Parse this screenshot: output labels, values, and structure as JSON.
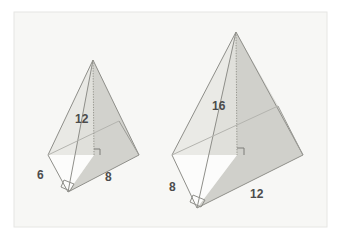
{
  "figure": {
    "title": "",
    "background_color": "#ffffff",
    "panel_color": "#f7f7f5",
    "panel_border_color": "#e3e3e0",
    "outline_color": "#8a8a86",
    "face_light_color": "#e4e4e0",
    "face_mid_color": "#d2d2cd",
    "face_dark_color": "#c0c0ba",
    "label_color": "#4c4c4c",
    "dash_color": "#9a9a95"
  },
  "shapes": [
    {
      "name": "left-pyramid",
      "labels": {
        "height": "12",
        "base_left_edge": "6",
        "base_right_edge": "8"
      },
      "geometry": {
        "apex": [
          93,
          60
        ],
        "base_left": [
          48,
          155
        ],
        "base_front": [
          68,
          192
        ],
        "base_right": [
          139,
          155
        ],
        "base_back": [
          119,
          121
        ],
        "foot": [
          94,
          155
        ]
      }
    },
    {
      "name": "right-pyramid",
      "labels": {
        "height": "16",
        "base_left_edge": "8",
        "base_right_edge": "12"
      },
      "geometry": {
        "apex": [
          236,
          32
        ],
        "base_left": [
          172,
          155
        ],
        "base_front": [
          197,
          208
        ],
        "base_right": [
          303,
          155
        ],
        "base_back": [
          278,
          106
        ],
        "foot": [
          237,
          155
        ]
      }
    }
  ],
  "dimension_labels": [
    {
      "name": "left-pyramid-height-label",
      "text": "12",
      "x": 75,
      "y": 112
    },
    {
      "name": "left-pyramid-left-edge-label",
      "text": "6",
      "x": 37,
      "y": 168
    },
    {
      "name": "left-pyramid-right-edge-label",
      "text": "8",
      "x": 105,
      "y": 170
    },
    {
      "name": "right-pyramid-height-label",
      "text": "16",
      "x": 212,
      "y": 99
    },
    {
      "name": "right-pyramid-left-edge-label",
      "text": "8",
      "x": 169,
      "y": 180
    },
    {
      "name": "right-pyramid-right-edge-label",
      "text": "12",
      "x": 250,
      "y": 187
    }
  ]
}
